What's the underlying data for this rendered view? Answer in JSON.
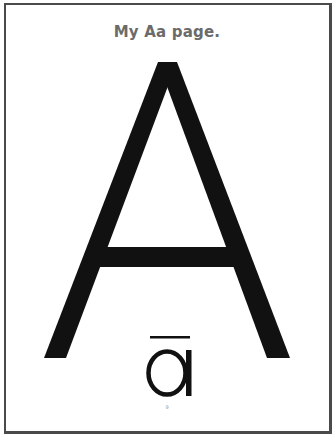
{
  "page": {
    "title": "My Aa page.",
    "uppercase_letter": "A",
    "lowercase_letter": "a",
    "lowercase_mark": "macron",
    "page_number": "9"
  },
  "colors": {
    "letter": "#111111",
    "title": "#6b6b6b",
    "border": "#4a4a4a",
    "background": "#ffffff"
  }
}
